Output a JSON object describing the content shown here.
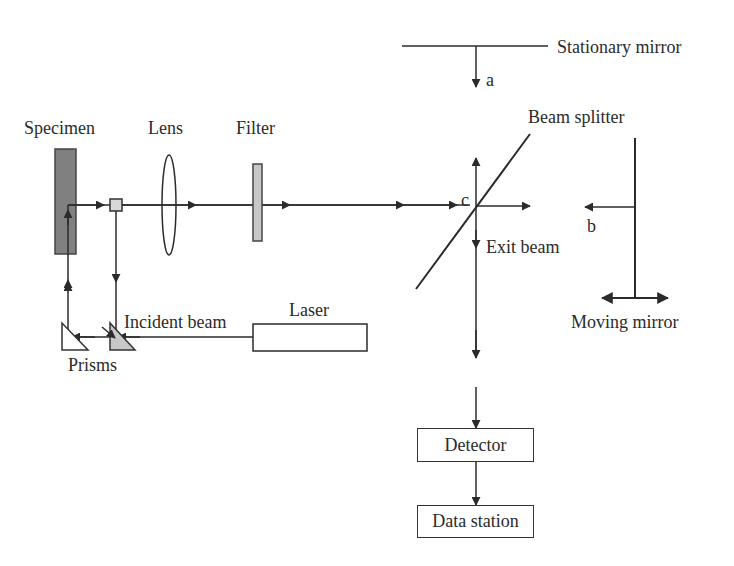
{
  "diagram": {
    "type": "optical-setup",
    "labels": {
      "specimen": "Specimen",
      "lens": "Lens",
      "filter": "Filter",
      "beam_splitter": "Beam splitter",
      "stationary_mirror": "Stationary mirror",
      "moving_mirror": "Moving mirror",
      "exit_beam": "Exit beam",
      "incident_beam": "Incident beam",
      "laser": "Laser",
      "prisms": "Prisms",
      "detector": "Detector",
      "data_station": "Data station",
      "point_a": "a",
      "point_b": "b",
      "point_c": "c"
    },
    "colors": {
      "line": "#2b2b2b",
      "specimen_fill": "#808080",
      "filter_fill": "#c8c8c8",
      "prism_fill": "#c8c8c8",
      "square_fill": "#d8d8d8"
    },
    "nodes": [
      {
        "id": "laser",
        "label": "Laser"
      },
      {
        "id": "prisms",
        "label": "Prisms"
      },
      {
        "id": "specimen",
        "label": "Specimen"
      },
      {
        "id": "lens",
        "label": "Lens"
      },
      {
        "id": "filter",
        "label": "Filter"
      },
      {
        "id": "beam_splitter",
        "label": "Beam splitter"
      },
      {
        "id": "stationary_mirror",
        "label": "Stationary mirror"
      },
      {
        "id": "moving_mirror",
        "label": "Moving mirror"
      },
      {
        "id": "detector",
        "label": "Detector"
      },
      {
        "id": "data_station",
        "label": "Data station"
      }
    ],
    "edges": [
      {
        "from": "laser",
        "to": "prisms",
        "label": "Incident beam"
      },
      {
        "from": "prisms",
        "to": "specimen"
      },
      {
        "from": "specimen",
        "to": "lens"
      },
      {
        "from": "lens",
        "to": "filter"
      },
      {
        "from": "filter",
        "to": "beam_splitter"
      },
      {
        "from": "beam_splitter",
        "to": "detector",
        "label": "Exit beam"
      },
      {
        "from": "detector",
        "to": "data_station"
      }
    ]
  }
}
